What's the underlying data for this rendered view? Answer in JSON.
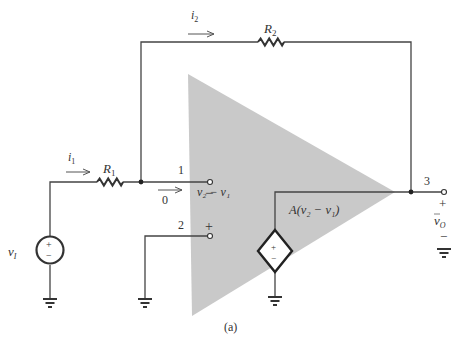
{
  "figure": {
    "caption": "(a)",
    "opamp_fill": "#c9c9c9",
    "wire_color": "#444444"
  },
  "labels": {
    "i1": "i",
    "i1_sub": "1",
    "i2": "i",
    "i2_sub": "2",
    "R1": "R",
    "R1_sub": "1",
    "R2": "R",
    "R2_sub": "2",
    "vI": "v",
    "vI_sub": "I",
    "node1": "1",
    "node2": "2",
    "node3": "3",
    "zero_current": "0",
    "minus_terminal": "−",
    "plus_terminal": "+",
    "diff_voltage": "v₂ − v₁",
    "vcvs": "A(v₂ − v₁)",
    "vO": "v",
    "vO_sub": "O",
    "out_plus": "+",
    "out_minus": "−",
    "src_plus": "+",
    "src_minus": "−",
    "dep_plus": "+",
    "dep_minus": "−"
  },
  "components": [
    {
      "id": "vI",
      "type": "independent-voltage-source"
    },
    {
      "id": "R1",
      "type": "resistor"
    },
    {
      "id": "R2",
      "type": "resistor"
    },
    {
      "id": "opamp",
      "type": "op-amp-equivalent"
    },
    {
      "id": "vcvs",
      "type": "dependent-voltage-source",
      "expr": "A(v2 - v1)"
    },
    {
      "id": "gnd1",
      "type": "ground"
    },
    {
      "id": "gnd2",
      "type": "ground"
    },
    {
      "id": "gnd3",
      "type": "ground"
    },
    {
      "id": "gnd4",
      "type": "ground"
    }
  ]
}
